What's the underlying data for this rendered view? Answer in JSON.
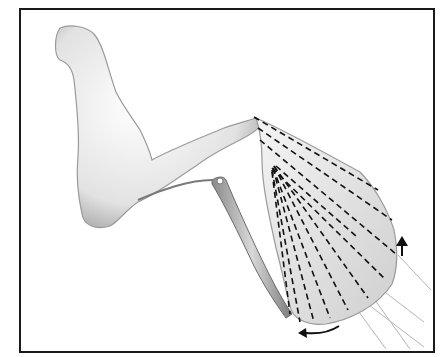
{
  "figure": {
    "type": "anatomical-illustration",
    "frame_color": "#1a1a1a",
    "background_color": "#ffffff",
    "shading_color": "#9a9a9a",
    "dash_color": "#111111",
    "arrow_color": "#111111",
    "guide_line_color": "#b0b0b0",
    "dashed_line_count": 11,
    "arrows": [
      {
        "name": "rotation-arrow-up",
        "direction": "up"
      },
      {
        "name": "rotation-arrow-left",
        "direction": "left-curved"
      }
    ],
    "guide_line_count": 4
  }
}
